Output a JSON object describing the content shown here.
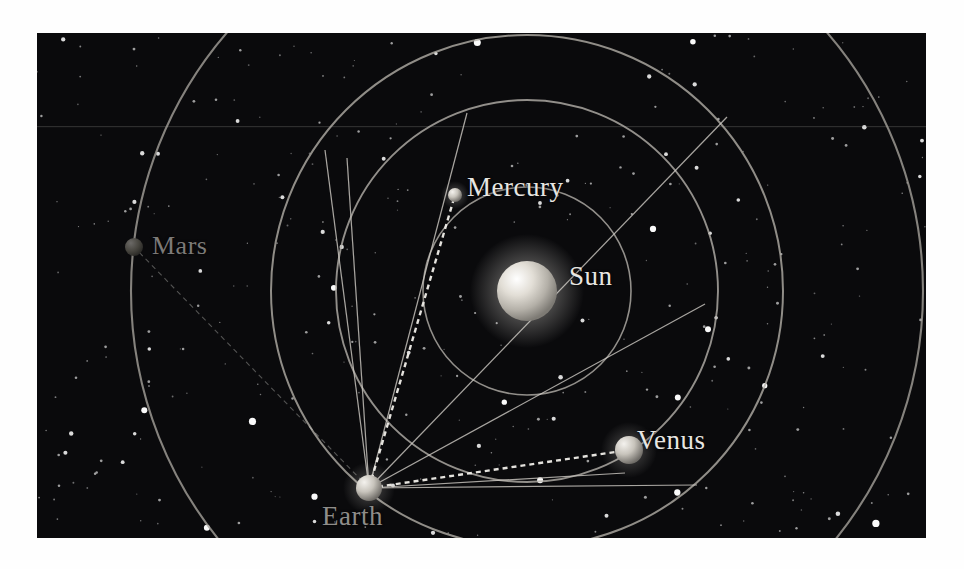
{
  "figure": {
    "kind": "orbit-diagram",
    "background_color": "#0a0a0c",
    "page_color": "#ffffff",
    "panel": {
      "x": 37,
      "y": 33,
      "width": 889,
      "height": 505
    }
  },
  "labels": {
    "sun": "Sun",
    "mercury": "Mercury",
    "venus": "Venus",
    "earth": "Earth",
    "mars": "Mars"
  },
  "chart_data": {
    "type": "scatter",
    "title": "",
    "xlabel": "",
    "ylabel": "",
    "grid": false,
    "legend_position": "none",
    "sun": {
      "label": "Sun",
      "cx": 490,
      "cy": 258,
      "r": 30,
      "color": "#d8d4cc"
    },
    "bodies": [
      {
        "name": "Mercury",
        "cx": 418,
        "cy": 162,
        "r": 7,
        "color": "#c9c5bd",
        "label_x": 430,
        "label_y": 139
      },
      {
        "name": "Venus",
        "cx": 592,
        "cy": 417,
        "r": 14,
        "color": "#d5d1c9",
        "label_x": 600,
        "label_y": 392
      },
      {
        "name": "Earth",
        "cx": 332,
        "cy": 455,
        "r": 13,
        "color": "#bdb9b2",
        "label_x": 285,
        "label_y": 468
      },
      {
        "name": "Mars",
        "cx": 97,
        "cy": 214,
        "r": 9,
        "color": "#4e4c49",
        "label_x": 115,
        "label_y": 198
      }
    ],
    "orbits": [
      {
        "name": "Mercury orbit",
        "cx": 490,
        "cy": 258,
        "r": 104,
        "color": "#b9b5ae",
        "width": 1.6
      },
      {
        "name": "Venus orbit",
        "cx": 490,
        "cy": 258,
        "r": 191,
        "color": "#b9b5ae",
        "width": 1.9
      },
      {
        "name": "Earth orbit",
        "cx": 490,
        "cy": 258,
        "r": 256,
        "color": "#b6b2ab",
        "width": 2.0
      },
      {
        "name": "Mars orbit",
        "cx": 490,
        "cy": 258,
        "r": 396,
        "color": "#a8a49d",
        "width": 2.1
      }
    ],
    "sight_lines": [
      {
        "from": "Earth",
        "x1": 332,
        "y1": 455,
        "x2": 288,
        "y2": 117
      },
      {
        "from": "Earth",
        "x1": 332,
        "y1": 455,
        "x2": 310,
        "y2": 125
      },
      {
        "from": "Earth",
        "x1": 332,
        "y1": 455,
        "x2": 430,
        "y2": 80
      },
      {
        "from": "Earth",
        "x1": 332,
        "y1": 455,
        "x2": 690,
        "y2": 84
      },
      {
        "from": "Earth",
        "x1": 332,
        "y1": 455,
        "x2": 668,
        "y2": 271
      },
      {
        "from": "Earth",
        "x1": 332,
        "y1": 455,
        "x2": 660,
        "y2": 452
      },
      {
        "from": "Earth",
        "x1": 332,
        "y1": 455,
        "x2": 588,
        "y2": 440
      }
    ],
    "dashed_sight_lines": [
      {
        "from": "Earth",
        "to": "Mercury",
        "x1": 332,
        "y1": 455,
        "x2": 418,
        "y2": 162
      },
      {
        "from": "Earth",
        "to": "Venus",
        "x1": 332,
        "y1": 455,
        "x2": 592,
        "y2": 417
      },
      {
        "from": "Earth",
        "to": "Mars",
        "x1": 332,
        "y1": 455,
        "x2": 97,
        "y2": 214
      }
    ],
    "stars_count": 320
  }
}
